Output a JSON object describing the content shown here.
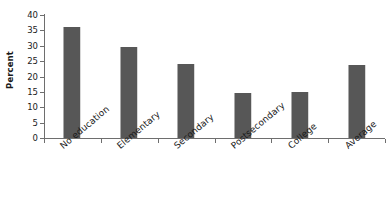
{
  "chart_data": {
    "type": "bar",
    "title": "",
    "subtitle": "",
    "xlabel": "",
    "ylabel": "Percent",
    "categories": [
      "No education",
      "Elementary",
      "Secondary",
      "Postsecondary",
      "College",
      "Average"
    ],
    "values": [
      36,
      29.5,
      24,
      14.5,
      15.1,
      23.7
    ],
    "series": [
      {
        "name": "Percent",
        "values": [
          36,
          29.5,
          24,
          14.5,
          15.1,
          23.7
        ]
      }
    ],
    "ylim": [
      0,
      40
    ],
    "y_ticks": [
      40,
      35,
      30,
      25,
      20,
      15,
      10,
      5,
      0
    ],
    "y_tick_labels": [
      "40",
      "35",
      "30",
      "25",
      "20",
      "15",
      "10",
      "5",
      "0"
    ],
    "grid": false,
    "legend": false,
    "legend_position": "none",
    "annotations": [],
    "bar_color": "#575757",
    "axis_color": "#6e6e6e",
    "text_color": "#1a1a1a",
    "background_color": "#ffffff",
    "x_label_rotation": -40
  }
}
